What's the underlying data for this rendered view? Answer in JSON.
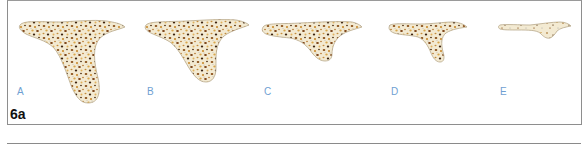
{
  "figure": {
    "id_label": "6a",
    "panel_border_color": "#8e8e8e",
    "label_color": "#6f9fd2",
    "fill_color": "#f3ead2",
    "outline_color": "#b8a88a",
    "stages": [
      {
        "label": "A",
        "description": "ridge-cross-section-tall"
      },
      {
        "label": "B",
        "description": "ridge-cross-section-reduced"
      },
      {
        "label": "C",
        "description": "ridge-cross-section-short"
      },
      {
        "label": "D",
        "description": "ridge-cross-section-thin-process"
      },
      {
        "label": "E",
        "description": "ridge-cross-section-flat"
      }
    ]
  }
}
